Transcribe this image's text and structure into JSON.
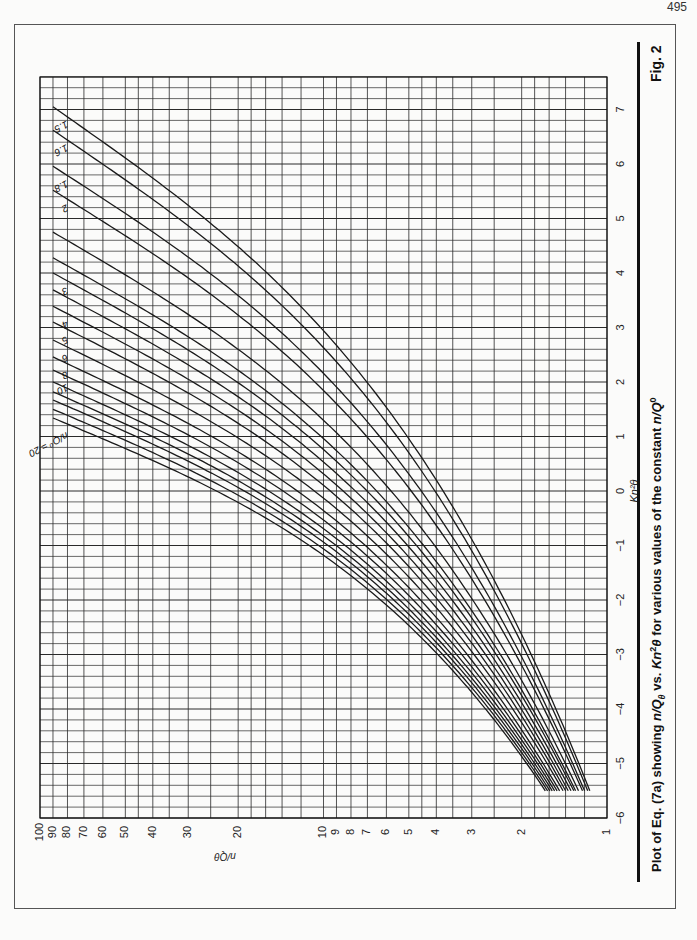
{
  "page": {
    "number": "495",
    "figure_label": "Fig. 2",
    "caption": {
      "prefix": "Plot of Eq. (7a) showing ",
      "var1": "n/Q",
      "var1_sub": "θ",
      "mid": " vs. ",
      "var2": "Kn",
      "var2_sup": "2",
      "var2_tail": "θ",
      "suffix": " for various values of the constant ",
      "var3": "n/Q",
      "var3_sup": "0"
    }
  },
  "chart_data": {
    "type": "line",
    "orientation": "rotated 90° (x-axis vertical on page, y-axis horizontal)",
    "xlabel": "Kn²θ",
    "ylabel": "n/Qθ",
    "xlim": [
      -6,
      7.6
    ],
    "ylim": [
      1,
      100
    ],
    "yscale": "log",
    "grid": true,
    "x_ticks": [
      -6,
      -5,
      -4,
      -3,
      -2,
      -1,
      0,
      1,
      2,
      3,
      4,
      5,
      6,
      7
    ],
    "x_minor_step": 0.2,
    "y_ticks": [
      1,
      2,
      3,
      4,
      5,
      6,
      7,
      8,
      9,
      10,
      20,
      30,
      40,
      50,
      60,
      70,
      80,
      90,
      100
    ],
    "y_tick_labels": [
      "1",
      "2",
      "3",
      "4",
      "5",
      "6",
      "7",
      "8",
      "9",
      "10",
      "20",
      "30",
      "40",
      "50",
      "60",
      "70",
      "80",
      "90",
      "100"
    ],
    "y_gridlines": [
      1,
      1.2,
      1.4,
      1.6,
      1.8,
      2,
      2.5,
      3,
      3.5,
      4,
      4.5,
      5,
      6,
      7,
      8,
      9,
      10,
      12,
      14,
      16,
      18,
      20,
      25,
      30,
      35,
      40,
      45,
      50,
      60,
      70,
      80,
      90,
      100
    ],
    "legend_title": "n/Q⁰",
    "series": [
      {
        "name": "1.5",
        "label": "1.5",
        "x_at_y90": 7.05,
        "y_at_xmin": 1.15
      },
      {
        "name": "1.6",
        "label": "1.6",
        "x_at_y90": 6.62,
        "y_at_xmin": 1.17
      },
      {
        "name": "1.8",
        "label": "1.8",
        "x_at_y90": 5.96,
        "y_at_xmin": 1.2
      },
      {
        "name": "2",
        "label": "2",
        "x_at_y90": 5.52,
        "y_at_xmin": 1.22
      },
      {
        "name": "2.5",
        "label": "",
        "x_at_y90": 4.75,
        "y_at_xmin": 1.26
      },
      {
        "name": "2.8",
        "label": "",
        "x_at_y90": 4.28,
        "y_at_xmin": 1.29
      },
      {
        "name": "3",
        "label": "3",
        "x_at_y90": 4.0,
        "y_at_xmin": 1.31
      },
      {
        "name": "3.5",
        "label": "",
        "x_at_y90": 3.69,
        "y_at_xmin": 1.34
      },
      {
        "name": "4",
        "label": "4",
        "x_at_y90": 3.39,
        "y_at_xmin": 1.37
      },
      {
        "name": "5",
        "label": "5",
        "x_at_y90": 3.1,
        "y_at_xmin": 1.4
      },
      {
        "name": "6",
        "label": "6",
        "x_at_y90": 2.77,
        "y_at_xmin": 1.43
      },
      {
        "name": "8",
        "label": "8",
        "x_at_y90": 2.46,
        "y_at_xmin": 1.47
      },
      {
        "name": "10",
        "label": "10",
        "x_at_y90": 2.22,
        "y_at_xmin": 1.5
      },
      {
        "name": "12",
        "label": "",
        "x_at_y90": 2.0,
        "y_at_xmin": 1.53
      },
      {
        "name": "14",
        "label": "",
        "x_at_y90": 1.82,
        "y_at_xmin": 1.56
      },
      {
        "name": "16",
        "label": "",
        "x_at_y90": 1.67,
        "y_at_xmin": 1.59
      },
      {
        "name": "18",
        "label": "",
        "x_at_y90": 1.5,
        "y_at_xmin": 1.62
      },
      {
        "name": "20",
        "label": "n/Q⁰ = 20",
        "x_at_y90": 1.34,
        "y_at_xmin": 1.65
      }
    ],
    "curve_x_min": -5.5
  },
  "style": {
    "line_color": "#1a1a1a",
    "grid_color": "#2a2a2a",
    "paper_color": "#fbfbfa"
  }
}
